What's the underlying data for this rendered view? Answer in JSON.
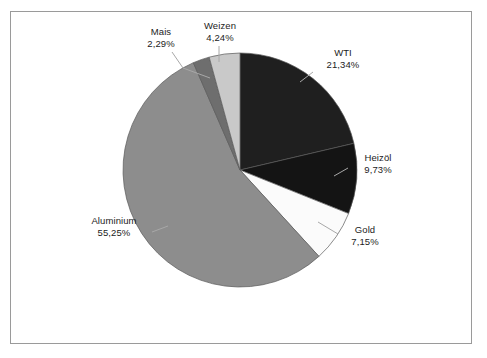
{
  "chart_data": {
    "type": "pie",
    "title": "",
    "subtitle": "",
    "xlabel": "",
    "ylabel": "",
    "legend_position": "none",
    "grid": false,
    "value_unit": "percent",
    "decimal_separator": ",",
    "start_angle_deg": 0,
    "direction": "clockwise",
    "categories": [
      "WTI",
      "Heizöl",
      "Gold",
      "Aluminium",
      "Mais",
      "Weizen"
    ],
    "values": [
      21.34,
      9.73,
      7.15,
      55.25,
      2.29,
      4.24
    ],
    "labels": [
      "21,34%",
      "9,73%",
      "7,15%",
      "55,25%",
      "2,29%",
      "4,24%"
    ],
    "colors": [
      "#1f1f1f",
      "#141414",
      "#fbfbfb",
      "#8d8d8d",
      "#6e6e6e",
      "#c9c9c9"
    ],
    "slices": [
      {
        "name": "WTI",
        "value": 21.34,
        "label": "21,34%",
        "color": "#1f1f1f"
      },
      {
        "name": "Heizöl",
        "value": 9.73,
        "label": "9,73%",
        "color": "#141414"
      },
      {
        "name": "Gold",
        "value": 7.15,
        "label": "7,15%",
        "color": "#fbfbfb"
      },
      {
        "name": "Aluminium",
        "value": 55.25,
        "label": "55,25%",
        "color": "#8d8d8d"
      },
      {
        "name": "Mais",
        "value": 2.29,
        "label": "2,29%",
        "color": "#6e6e6e"
      },
      {
        "name": "Weizen",
        "value": 4.24,
        "label": "4,24%",
        "color": "#c9c9c9"
      }
    ]
  },
  "chart": {
    "labels": {
      "wti": {
        "name": "WTI",
        "value": "21,34%"
      },
      "heizoel": {
        "name": "Heizöl",
        "value": "9,73%"
      },
      "gold": {
        "name": "Gold",
        "value": "7,15%"
      },
      "aluminium": {
        "name": "Aluminium",
        "value": "55,25%"
      },
      "mais": {
        "name": "Mais",
        "value": "2,29%"
      },
      "weizen": {
        "name": "Weizen",
        "value": "4,24%"
      }
    }
  },
  "style": {
    "background": "#ffffff",
    "frame_border": "#9a9a9a",
    "text_color": "#1c1c1c",
    "leader_line": "#a8a8a8",
    "slice_outline": "#5a5a5a"
  }
}
